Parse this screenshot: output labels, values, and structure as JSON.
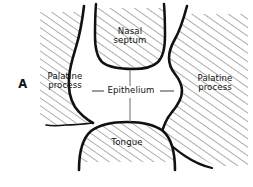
{
  "figure": {
    "panel_letter": "A",
    "caption_subject": "Palatal shelves and nasal septum cross-section",
    "ink_color": "#111111",
    "hatch_color": "#5a5a5a",
    "background_color": "#ffffff",
    "leader_color": "#6b6b6b"
  },
  "labels": {
    "nasal_septum": "Nasal\nseptum",
    "palatine_process_left": "Palatine\nprocess",
    "palatine_process_right": "Palatine\nprocess",
    "epithelium": "Epithelium",
    "tongue": "Tongue"
  },
  "structures": [
    {
      "name": "nasal-septum",
      "label": "Nasal septum",
      "position": "top-center",
      "fill": "hatched"
    },
    {
      "name": "palatine-process-left",
      "label": "Palatine process",
      "position": "left",
      "fill": "hatched"
    },
    {
      "name": "palatine-process-right",
      "label": "Palatine process",
      "position": "right",
      "fill": "hatched"
    },
    {
      "name": "tongue",
      "label": "Tongue",
      "position": "bottom-center",
      "fill": "hatched"
    },
    {
      "name": "epithelium",
      "label": "Epithelium",
      "position": "center",
      "fill": "white"
    }
  ],
  "leaders": {
    "epithelium_up": "vertical line from Epithelium label to nasal septum border",
    "epithelium_down": "vertical line from Epithelium label to tongue border",
    "epithelium_left": "horizontal line from Epithelium label to left palatine process",
    "epithelium_right": "horizontal line from Epithelium label to right palatine process"
  }
}
